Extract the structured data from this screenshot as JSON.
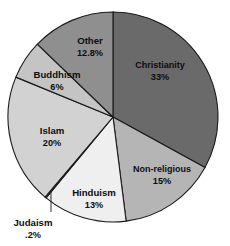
{
  "chart_data": {
    "type": "pie",
    "title": "",
    "subtitle": "",
    "xlabel": "",
    "ylabel": "",
    "legend": "none",
    "grid": false,
    "units": "percent",
    "categories": [
      "Christianity",
      "Non-religious",
      "Hinduism",
      "Judaism",
      "Islam",
      "Buddhism",
      "Other"
    ],
    "values": [
      33,
      15,
      13,
      0.2,
      20,
      6,
      12.8
    ],
    "value_labels": [
      "33%",
      "15%",
      "13%",
      ".2%",
      "20%",
      "6%",
      "12.8%"
    ],
    "colors": [
      "#6a6a6a",
      "#b5b5b5",
      "#efefef",
      "#fdfdfd",
      "#d2d2d2",
      "#c4c4c4",
      "#8f8f8f"
    ],
    "start_angle_deg": 0,
    "direction": "clockwise",
    "slices": [
      {
        "name": "Christianity",
        "value": 33,
        "value_label": "33%",
        "color": "#6a6a6a",
        "label_inside": true
      },
      {
        "name": "Non-religious",
        "value": 15,
        "value_label": "15%",
        "color": "#b5b5b5",
        "label_inside": true
      },
      {
        "name": "Hinduism",
        "value": 13,
        "value_label": "13%",
        "color": "#efefef",
        "label_inside": true
      },
      {
        "name": "Judaism",
        "value": 0.2,
        "value_label": ".2%",
        "color": "#fdfdfd",
        "label_inside": false
      },
      {
        "name": "Islam",
        "value": 20,
        "value_label": "20%",
        "color": "#d2d2d2",
        "label_inside": true
      },
      {
        "name": "Buddhism",
        "value": 6,
        "value_label": "6%",
        "color": "#c4c4c4",
        "label_inside": true
      },
      {
        "name": "Other",
        "value": 12.8,
        "value_label": "12.8%",
        "color": "#8f8f8f",
        "label_inside": true
      }
    ]
  },
  "style": {
    "background": "#ffffff",
    "outline": "#1a1a1a",
    "text": "#0d0d0d"
  }
}
